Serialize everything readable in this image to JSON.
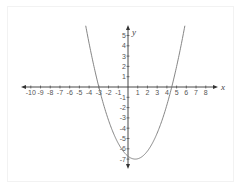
{
  "chart_data": {
    "type": "line",
    "title": "",
    "xlabel": "x",
    "ylabel": "y",
    "xlim": [
      -10.5,
      8.8
    ],
    "ylim": [
      -7.8,
      6
    ],
    "x_ticks": [
      -10,
      -9,
      -8,
      -7,
      -6,
      -5,
      -4,
      -3,
      -2,
      -1,
      1,
      2,
      3,
      4,
      5,
      6,
      7,
      8
    ],
    "y_ticks": [
      5,
      4,
      3,
      2,
      1,
      -1,
      -2,
      -3,
      -4,
      -5,
      -6,
      -7
    ],
    "grid": false,
    "series": [
      {
        "name": "parabola",
        "equation_approx": "y = 0.5(x+3)(x-4.5)",
        "roots": [
          -3,
          4.5
        ],
        "vertex": [
          0.75,
          -7
        ],
        "color": "#777777"
      }
    ]
  },
  "axes": {
    "x_label": "x",
    "y_label": "y"
  },
  "colors": {
    "axis": "#333333",
    "curve": "#777777",
    "labels": "#555555"
  }
}
